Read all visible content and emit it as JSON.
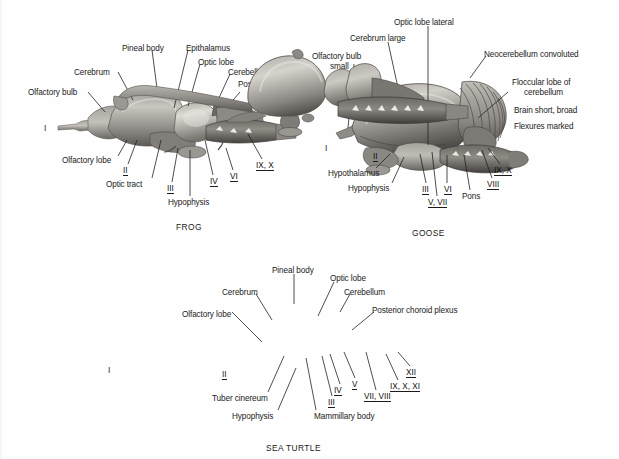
{
  "figure": {
    "type": "comparative-anatomy-plate",
    "background_color": "#fefefe",
    "ink_color": "#1b1b1b"
  },
  "panels": [
    {
      "id": "frog",
      "caption": "FROG",
      "caption_pos": [
        176,
        222
      ],
      "labels": [
        {
          "text": "Olfactory bulb",
          "x": 28,
          "y": 88,
          "align": "left",
          "leader": [
            88,
            92,
            105,
            112
          ]
        },
        {
          "text": "Cerebrum",
          "x": 74,
          "y": 68,
          "align": "left",
          "leader": [
            118,
            72,
            133,
            100
          ]
        },
        {
          "text": "Pineal body",
          "x": 122,
          "y": 44,
          "align": "left",
          "leader": [
            152,
            50,
            158,
            96
          ]
        },
        {
          "text": "Epithalamus",
          "x": 186,
          "y": 44,
          "align": "left",
          "leader": [
            188,
            50,
            174,
            108
          ]
        },
        {
          "text": "Optic lobe",
          "x": 198,
          "y": 58,
          "align": "left",
          "leader": [
            200,
            64,
            188,
            106
          ]
        },
        {
          "text": "Cerebellum small",
          "x": 228,
          "y": 68,
          "align": "left",
          "leader": [
            230,
            74,
            218,
            100
          ]
        },
        {
          "text": "Posterior choroid",
          "x": 238,
          "y": 80,
          "align": "left",
          "leader": [
            240,
            92,
            228,
            106
          ]
        },
        {
          "text": "plexus",
          "x": 252,
          "y": 90,
          "align": "left",
          "leader": null
        },
        {
          "text": "Olfactory lobe",
          "x": 62,
          "y": 156,
          "align": "left",
          "leader": [
            118,
            156,
            127,
            140
          ]
        },
        {
          "text": "Optic tract",
          "x": 106,
          "y": 180,
          "align": "left",
          "leader": [
            152,
            178,
            161,
            140
          ]
        },
        {
          "text": "Hypophysis",
          "x": 168,
          "y": 198,
          "align": "left",
          "leader": [
            190,
            196,
            190,
            150
          ]
        }
      ],
      "numerals": [
        {
          "text": "I",
          "x": 44,
          "y": 124,
          "underline": false,
          "leader": null
        },
        {
          "text": "II",
          "x": 123,
          "y": 166,
          "underline": true,
          "leader": [
            128,
            164,
            137,
            140
          ]
        },
        {
          "text": "III",
          "x": 167,
          "y": 184,
          "underline": true,
          "leader": [
            172,
            182,
            178,
            148
          ]
        },
        {
          "text": "IV",
          "x": 210,
          "y": 177,
          "underline": true,
          "leader": [
            213,
            175,
            205,
            140
          ]
        },
        {
          "text": "VI",
          "x": 230,
          "y": 172,
          "underline": true,
          "leader": [
            233,
            170,
            226,
            148
          ]
        },
        {
          "text": "IX, X",
          "x": 256,
          "y": 161,
          "underline": true,
          "leader": [
            262,
            159,
            248,
            134
          ]
        }
      ]
    },
    {
      "id": "goose",
      "caption": "GOOSE",
      "caption_pos": [
        412,
        228
      ],
      "labels": [
        {
          "text": "Optic lobe lateral",
          "x": 394,
          "y": 18,
          "align": "left",
          "leader": [
            428,
            26,
            428,
            145
          ]
        },
        {
          "text": "Cerebrum large",
          "x": 350,
          "y": 34,
          "align": "left",
          "leader": [
            388,
            42,
            400,
            97
          ]
        },
        {
          "text": "Olfactory bulb",
          "x": 312,
          "y": 52,
          "align": "left",
          "leader": [
            354,
            64,
            348,
            128
          ]
        },
        {
          "text": "small",
          "x": 330,
          "y": 62,
          "align": "left",
          "leader": null
        },
        {
          "text": "Neocerebellum convoluted",
          "x": 484,
          "y": 50,
          "align": "left",
          "leader": [
            486,
            56,
            470,
            78
          ]
        },
        {
          "text": "Floccular lobe of",
          "x": 512,
          "y": 78,
          "align": "left",
          "leader": [
            508,
            92,
            478,
            118
          ]
        },
        {
          "text": "cerebellum",
          "x": 524,
          "y": 88,
          "align": "left",
          "leader": null
        },
        {
          "text": "Brain short, broad",
          "x": 514,
          "y": 106,
          "align": "left",
          "leader": null
        },
        {
          "text": "Flexures marked",
          "x": 514,
          "y": 122,
          "align": "left",
          "leader": null
        },
        {
          "text": "Hypothalamus",
          "x": 328,
          "y": 169,
          "align": "left",
          "leader": [
            376,
            168,
            390,
            154
          ]
        },
        {
          "text": "Hypophysis",
          "x": 348,
          "y": 184,
          "align": "left",
          "leader": [
            392,
            183,
            404,
            157
          ]
        },
        {
          "text": "Pons",
          "x": 462,
          "y": 192,
          "align": "left",
          "leader": [
            470,
            190,
            464,
            155
          ]
        }
      ],
      "numerals": [
        {
          "text": "I",
          "x": 325,
          "y": 144,
          "underline": false,
          "leader": null
        },
        {
          "text": "II",
          "x": 373,
          "y": 152,
          "underline": true,
          "leader": null
        },
        {
          "text": "III",
          "x": 422,
          "y": 185,
          "underline": true,
          "leader": [
            426,
            183,
            420,
            154
          ]
        },
        {
          "text": "V, VII",
          "x": 428,
          "y": 198,
          "underline": true,
          "leader": [
            437,
            196,
            432,
            152
          ]
        },
        {
          "text": "VI",
          "x": 444,
          "y": 185,
          "underline": true,
          "leader": [
            447,
            183,
            447,
            155
          ]
        },
        {
          "text": "VIII",
          "x": 487,
          "y": 180,
          "underline": true,
          "leader": [
            492,
            178,
            482,
            150
          ]
        },
        {
          "text": "IX, X",
          "x": 494,
          "y": 166,
          "underline": true,
          "leader": [
            500,
            164,
            488,
            148
          ]
        }
      ]
    },
    {
      "id": "sea-turtle",
      "caption": "SEA TURTLE",
      "caption_pos": [
        266,
        443
      ],
      "labels": [
        {
          "text": "Pineal body",
          "x": 272,
          "y": 266,
          "align": "left",
          "leader": [
            294,
            274,
            294,
            304
          ]
        },
        {
          "text": "Optic lobe",
          "x": 330,
          "y": 274,
          "align": "left",
          "leader": [
            334,
            282,
            318,
            316
          ]
        },
        {
          "text": "Cerebrum",
          "x": 222,
          "y": 288,
          "align": "left",
          "leader": [
            256,
            294,
            272,
            320
          ]
        },
        {
          "text": "Cerebellum",
          "x": 344,
          "y": 288,
          "align": "left",
          "leader": [
            350,
            294,
            340,
            312
          ]
        },
        {
          "text": "Olfactory lobe",
          "x": 182,
          "y": 310,
          "align": "left",
          "leader": [
            232,
            312,
            262,
            342
          ]
        },
        {
          "text": "Posterior choroid plexus",
          "x": 372,
          "y": 306,
          "align": "left",
          "leader": [
            374,
            312,
            352,
            330
          ]
        },
        {
          "text": "Tuber cinereum",
          "x": 212,
          "y": 394,
          "align": "left",
          "leader": [
            268,
            392,
            284,
            356
          ]
        },
        {
          "text": "Hypophysis",
          "x": 232,
          "y": 412,
          "align": "left",
          "leader": [
            278,
            410,
            296,
            368
          ]
        },
        {
          "text": "Mammillary body",
          "x": 314,
          "y": 412,
          "align": "left",
          "leader": [
            316,
            410,
            306,
            358
          ]
        }
      ],
      "numerals": [
        {
          "text": "I",
          "x": 108,
          "y": 366,
          "underline": false,
          "leader": null
        },
        {
          "text": "II",
          "x": 222,
          "y": 370,
          "underline": true,
          "leader": null
        },
        {
          "text": "III",
          "x": 328,
          "y": 398,
          "underline": true,
          "leader": [
            332,
            396,
            322,
            356
          ]
        },
        {
          "text": "IV",
          "x": 334,
          "y": 386,
          "underline": true,
          "leader": [
            340,
            384,
            330,
            354
          ]
        },
        {
          "text": "V",
          "x": 352,
          "y": 380,
          "underline": true,
          "leader": [
            355,
            378,
            344,
            352
          ]
        },
        {
          "text": "VII, VIII",
          "x": 364,
          "y": 392,
          "underline": true,
          "leader": [
            376,
            390,
            366,
            352
          ]
        },
        {
          "text": "IX, X, XI",
          "x": 390,
          "y": 382,
          "underline": true,
          "leader": [
            398,
            380,
            386,
            354
          ]
        },
        {
          "text": "XII",
          "x": 406,
          "y": 368,
          "underline": true,
          "leader": [
            410,
            366,
            398,
            352
          ]
        }
      ]
    }
  ]
}
